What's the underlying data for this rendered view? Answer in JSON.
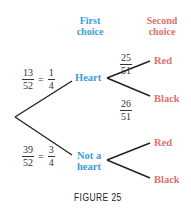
{
  "headers": {
    "first": [
      "First",
      "choice"
    ],
    "second": [
      "Second",
      "choice"
    ]
  },
  "first_branch": {
    "top": {
      "label": "Heart",
      "prob": {
        "num": "13",
        "den": "52",
        "eq": "=",
        "simp_num": "1",
        "simp_den": "4"
      }
    },
    "bottom": {
      "label": [
        "Not a",
        "heart"
      ],
      "prob": {
        "num": "39",
        "den": "52",
        "eq": "=",
        "simp_num": "3",
        "simp_den": "4"
      }
    }
  },
  "second_branch": {
    "heart": {
      "red": {
        "label": "Red",
        "prob": {
          "num": "25",
          "den": "51"
        }
      },
      "black": {
        "label": "Black",
        "prob": {
          "num": "26",
          "den": "51"
        }
      }
    },
    "not_heart": {
      "red": {
        "label": "Red"
      },
      "black": {
        "label": "Black"
      }
    }
  },
  "caption": "FIGURE 25",
  "colors": {
    "first_choice": "#3aa0d8",
    "second_choice": "#e0716a",
    "lines": "#222222"
  }
}
